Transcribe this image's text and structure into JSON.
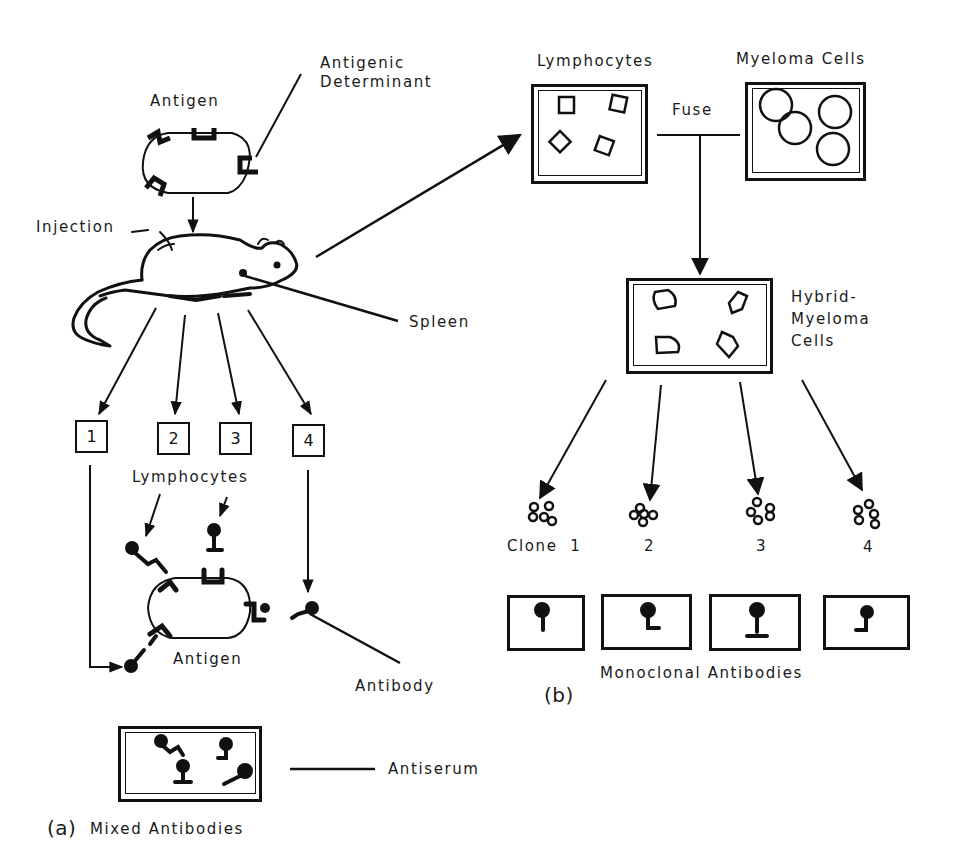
{
  "figure": {
    "panel_a": {
      "panel_label": "(a)",
      "antigen_label": "Antigen",
      "antigenic_determinant_label": [
        "Antigenic",
        "Determinant"
      ],
      "injection_label": "Injection",
      "spleen_label": "Spleen",
      "lymphocyte_boxes": [
        "1",
        "2",
        "3",
        "4"
      ],
      "lymphocytes_label": "Lymphocytes",
      "bound_antigen_label": "Antigen",
      "antibody_label": "Antibody",
      "antiserum_label": "Antiserum",
      "mixed_antibodies_label": "Mixed Antibodies"
    },
    "panel_b": {
      "panel_label": "(b)",
      "lymphocytes_dish_label": "Lymphocytes",
      "myeloma_dish_label": "Myeloma Cells",
      "fuse_label": "Fuse",
      "hybrid_label": [
        "Hybrid-",
        "Myeloma",
        "Cells"
      ],
      "clone_prefix": "Clone",
      "clones": [
        "1",
        "2",
        "3",
        "4"
      ],
      "monoclonal_label": "Monoclonal Antibodies"
    }
  },
  "colors": {
    "ink": "#111111",
    "background": "#ffffff"
  }
}
